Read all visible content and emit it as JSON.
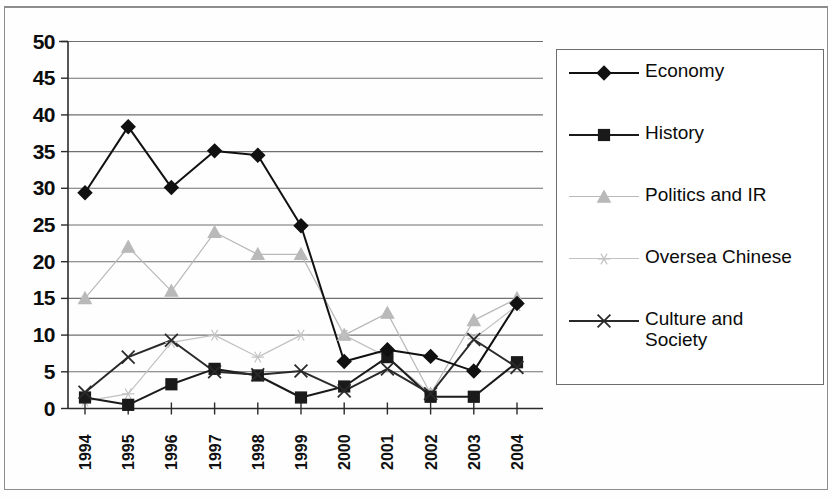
{
  "chart_data": {
    "type": "line",
    "title": "",
    "subtitle": "",
    "xlabel": "",
    "ylabel": "",
    "categories": [
      "1994",
      "1995",
      "1996",
      "1997",
      "1998",
      "1999",
      "2000",
      "2001",
      "2002",
      "2003",
      "2004"
    ],
    "x": [
      1994,
      1995,
      1996,
      1997,
      1998,
      1999,
      2000,
      2001,
      2002,
      2003,
      2004
    ],
    "ylim": [
      0,
      50
    ],
    "xlim": [
      1994,
      2004
    ],
    "ytick_labels": [
      "0",
      "5",
      "10",
      "15",
      "20",
      "25",
      "30",
      "35",
      "40",
      "45",
      "50"
    ],
    "ytick_values": [
      0,
      5,
      10,
      15,
      20,
      25,
      30,
      35,
      40,
      45,
      50
    ],
    "ytick_step": 5,
    "grid": true,
    "grid_axis": "y",
    "legend_position": "right",
    "series": [
      {
        "name": "Economy",
        "marker": "diamond",
        "color": "#111111",
        "values": [
          29.4,
          38.4,
          30.1,
          35.1,
          34.5,
          24.9,
          6.4,
          8.0,
          7.1,
          5.1,
          14.3
        ]
      },
      {
        "name": "History",
        "marker": "square",
        "color": "#1a1a1a",
        "values": [
          1.5,
          0.5,
          3.3,
          5.4,
          4.5,
          1.5,
          3.0,
          7.0,
          1.6,
          1.6,
          6.3
        ]
      },
      {
        "name": "Politics and IR",
        "marker": "triangle",
        "color": "#b9b9b9",
        "values": [
          15.0,
          22.0,
          16.0,
          24.0,
          21.0,
          21.0,
          10.0,
          13.0,
          2.0,
          12.0,
          15.0
        ]
      },
      {
        "name": "Oversea Chinese",
        "marker": "asterisk",
        "color": "#c2c2c2",
        "values": [
          1.0,
          2.0,
          9.0,
          10.0,
          7.0,
          10.0,
          10.0,
          7.0,
          2.0,
          9.5,
          14.0
        ]
      },
      {
        "name": "Culture and Society",
        "marker": "cross",
        "color": "#2a2a2a",
        "values": [
          2.2,
          7.0,
          9.3,
          5.0,
          4.6,
          5.1,
          2.4,
          5.4,
          2.0,
          9.4,
          5.6
        ]
      }
    ]
  },
  "legend": {
    "entries": [
      {
        "label": "Economy",
        "marker": "diamond-marker-icon"
      },
      {
        "label": "History",
        "marker": "square-marker-icon"
      },
      {
        "label": "Politics and IR",
        "marker": "triangle-marker-icon"
      },
      {
        "label": "Oversea Chinese",
        "marker": "asterisk-marker-icon"
      },
      {
        "label": "Culture and\nSociety",
        "marker": "cross-marker-icon"
      }
    ]
  }
}
